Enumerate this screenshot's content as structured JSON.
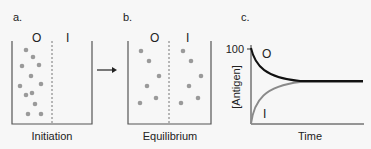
{
  "panels": {
    "a": {
      "label": "a.",
      "outside_label": "O",
      "inside_label": "I",
      "caption": "Initiation",
      "dots_outside": [
        [
          26,
          50
        ],
        [
          33,
          57
        ],
        [
          22,
          66
        ],
        [
          39,
          65
        ],
        [
          31,
          76
        ],
        [
          20,
          86
        ],
        [
          41,
          84
        ],
        [
          26,
          95
        ],
        [
          32,
          93
        ],
        [
          35,
          104
        ],
        [
          28,
          114
        ],
        [
          41,
          114
        ]
      ],
      "dots_inside": []
    },
    "arrow": {
      "direction": "right"
    },
    "b": {
      "label": "b.",
      "outside_label": "O",
      "inside_label": "I",
      "caption": "Equilibrium",
      "dots_outside": [
        [
          141,
          51
        ],
        [
          149,
          61
        ],
        [
          159,
          76
        ],
        [
          147,
          86
        ],
        [
          140,
          103
        ],
        [
          156,
          98
        ]
      ],
      "dots_inside": [
        [
          183,
          51
        ],
        [
          191,
          61
        ],
        [
          201,
          76
        ],
        [
          189,
          86
        ],
        [
          181,
          103
        ],
        [
          198,
          98
        ]
      ]
    },
    "c": {
      "label": "c.",
      "y_tick_label": "100",
      "ylabel": "[Antigen]",
      "xlabel": "Time",
      "curve_labels": {
        "outside": "O",
        "inside": "I"
      }
    }
  },
  "chart_data": {
    "type": "line",
    "title": "",
    "xlabel": "Time",
    "ylabel": "[Antigen]",
    "y_ticks": [
      100
    ],
    "grid": false,
    "series": [
      {
        "name": "O",
        "color": "#111111",
        "description": "decays exponentially from 100 to equilibrium (~50)",
        "x": [
          0,
          1,
          2,
          3,
          4,
          5,
          6,
          8,
          10
        ],
        "values": [
          100,
          78,
          65,
          57,
          53,
          51,
          50,
          50,
          50
        ]
      },
      {
        "name": "I",
        "color": "#888888",
        "description": "rises from 0 to equilibrium (~50)",
        "x": [
          0,
          1,
          2,
          3,
          4,
          5,
          6,
          8,
          10
        ],
        "values": [
          0,
          22,
          35,
          43,
          47,
          49,
          50,
          50,
          50
        ]
      }
    ]
  },
  "colors": {
    "background": "#f7f7f7",
    "dot": "#9a9a9a",
    "beaker": "#555555",
    "curve_O": "#111111",
    "curve_I": "#888888"
  }
}
